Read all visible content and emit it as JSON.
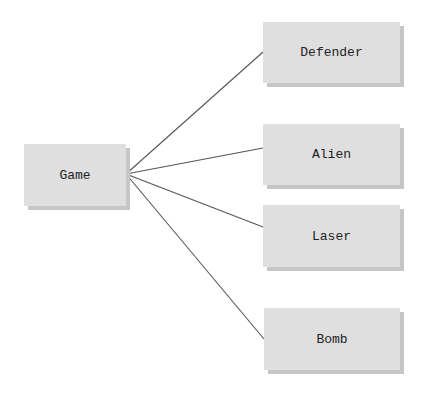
{
  "diagram": {
    "root": {
      "label": "Game",
      "x": 24,
      "y": 144,
      "w": 102,
      "h": 62
    },
    "children": [
      {
        "label": "Defender",
        "x": 263,
        "y": 22,
        "w": 137,
        "h": 61,
        "anchor_y": 52
      },
      {
        "label": "Alien",
        "x": 263,
        "y": 124,
        "w": 137,
        "h": 61,
        "anchor_y": 148
      },
      {
        "label": "Laser",
        "x": 263,
        "y": 205,
        "w": 137,
        "h": 62,
        "anchor_y": 227
      },
      {
        "label": "Bomb",
        "x": 264,
        "y": 308,
        "w": 136,
        "h": 62,
        "anchor_y": 339
      }
    ],
    "origin": {
      "x": 126,
      "y": 174
    },
    "colors": {
      "box": "#dfdfdf",
      "shadow": "#c6c6c6",
      "line": "#555555",
      "text": "#222222"
    }
  }
}
